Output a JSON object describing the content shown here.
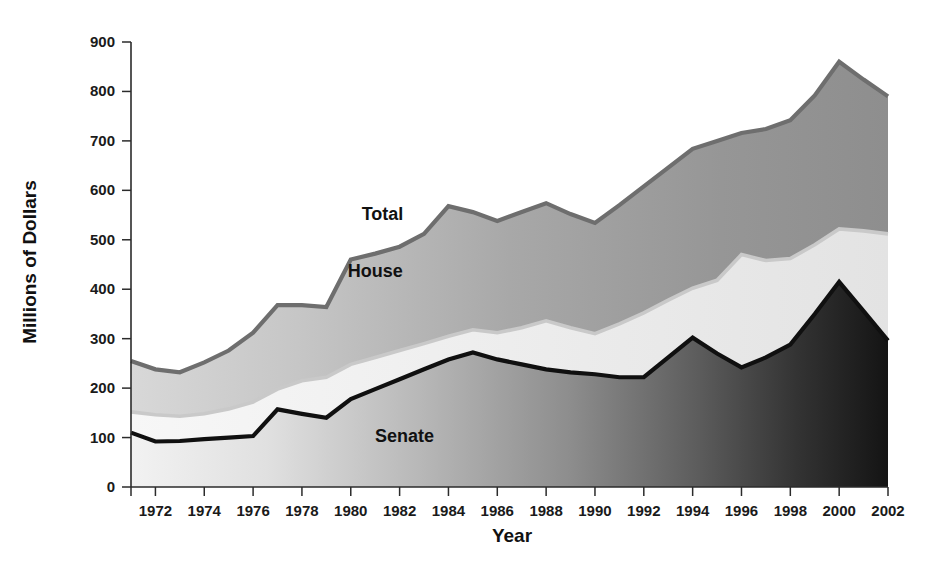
{
  "chart_data": {
    "type": "area",
    "title": "",
    "subtitle": "",
    "xlabel": "Year",
    "ylabel": "Millions of Dollars",
    "xlim": [
      1971,
      2002
    ],
    "ylim": [
      0,
      900
    ],
    "ytick_step": 100,
    "xtick_step": 2,
    "grid": false,
    "legend_position": "inline-annotations",
    "stacked": true,
    "stack_order": [
      "Senate",
      "House",
      "Total"
    ],
    "note": "Bands are cumulative: Senate is the bottom band, House band is the increment from Senate to House cumulative line, Total band is the increment from House to Total line.",
    "yticks": [
      0,
      100,
      200,
      300,
      400,
      500,
      600,
      700,
      800,
      900
    ],
    "xticks": [
      1972,
      1974,
      1976,
      1978,
      1980,
      1982,
      1984,
      1986,
      1988,
      1990,
      1992,
      1994,
      1996,
      1998,
      2000,
      2002
    ],
    "x": [
      1971,
      1972,
      1973,
      1974,
      1975,
      1976,
      1977,
      1978,
      1979,
      1980,
      1981,
      1982,
      1983,
      1984,
      1985,
      1986,
      1987,
      1988,
      1989,
      1990,
      1991,
      1992,
      1993,
      1994,
      1995,
      1996,
      1997,
      1998,
      1999,
      2000,
      2001,
      2002
    ],
    "series": [
      {
        "name": "Senate",
        "label": "Senate",
        "color": "#4d4d4d",
        "line_color": "#111111",
        "values": [
          110,
          92,
          93,
          97,
          100,
          103,
          157,
          148,
          140,
          178,
          198,
          218,
          238,
          258,
          272,
          258,
          248,
          238,
          232,
          228,
          222,
          222,
          262,
          302,
          270,
          242,
          262,
          288,
          350,
          415,
          356,
          296
        ]
      },
      {
        "name": "House",
        "label": "House",
        "color": "#eaeaea",
        "line_color": "#c3c3c3",
        "values": [
          152,
          146,
          143,
          148,
          158,
          172,
          198,
          215,
          222,
          248,
          262,
          276,
          290,
          305,
          318,
          312,
          322,
          336,
          322,
          310,
          330,
          352,
          378,
          402,
          418,
          470,
          458,
          462,
          490,
          522,
          518,
          512
        ]
      },
      {
        "name": "Total",
        "label": "Total",
        "color": "#9b9b9b",
        "line_color": "#6e6e6e",
        "values": [
          255,
          238,
          232,
          252,
          276,
          312,
          368,
          368,
          364,
          460,
          472,
          486,
          512,
          568,
          556,
          538,
          556,
          574,
          552,
          534,
          570,
          608,
          646,
          684,
          700,
          716,
          724,
          742,
          792,
          860,
          824,
          790
        ]
      }
    ],
    "annotations": [
      {
        "text": "Total",
        "x": 1981.3,
        "y": 540
      },
      {
        "text": "House",
        "x": 1981.0,
        "y": 425
      },
      {
        "text": "Senate",
        "x": 1982.2,
        "y": 92
      }
    ]
  },
  "axis": {
    "y_title": "Millions of Dollars",
    "x_title": "Year"
  }
}
